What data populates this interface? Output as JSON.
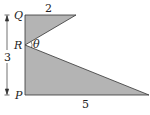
{
  "diagram": {
    "type": "geometry-figure",
    "points": {
      "Q": "Q",
      "R": "R",
      "P": "P"
    },
    "angle_label": "θ",
    "dimensions": {
      "top": "2",
      "left": "3",
      "bottom": "5"
    },
    "colors": {
      "fill": "#b4b4b4",
      "stroke": "#333333"
    }
  }
}
